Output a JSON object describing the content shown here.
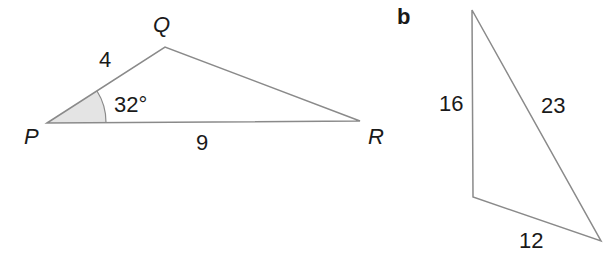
{
  "figure_a": {
    "vertices": {
      "P": "P",
      "Q": "Q",
      "R": "R"
    },
    "sides": {
      "PQ": "4",
      "PR": "9"
    },
    "angle_P": "32°"
  },
  "figure_b": {
    "part_label": "b",
    "sides": {
      "left": "16",
      "hypotenuse": "23",
      "bottom": "12"
    }
  },
  "colors": {
    "line": "#8a8a8a",
    "shade": "#e6e6e6",
    "text": "#1a1a1a"
  }
}
